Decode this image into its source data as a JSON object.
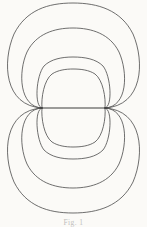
{
  "figure": {
    "caption": "Fig. 1",
    "background_color": "#fbfaf7",
    "line_color": "#4a4a4a",
    "axis_color": "#3d3d3d"
  },
  "chart_data": {
    "type": "line",
    "xlabel": "",
    "ylabel": "",
    "grid": false,
    "legend": "none",
    "xlim": [
      0,
      147
    ],
    "ylim": [
      0,
      227
    ],
    "axis_y": 108,
    "nodes": [
      {
        "name": "left-node",
        "x": 42,
        "y": 108
      },
      {
        "name": "right-node",
        "x": 105,
        "y": 108
      }
    ],
    "axis_segment": {
      "x1": 40,
      "x2": 107,
      "y": 108
    },
    "series": [
      {
        "name": "upper-loop-outer",
        "half": "upper",
        "rank": 1,
        "apex_y": 3,
        "left_x": 3,
        "right_x": 144,
        "path": "M 42 108 C 4 106 2 62 14 34 C 26 10 48 3 73 3 C 98 3 121 10 133 34 C 145 62 143 106 105 108"
      },
      {
        "name": "upper-loop-second",
        "half": "upper",
        "rank": 2,
        "apex_y": 28,
        "left_x": 18,
        "right_x": 129,
        "path": "M 42 108 C 19 107 18 72 27 52 C 36 34 54 28 73 28 C 92 28 110 34 119 52 C 128 72 128 107 105 108"
      },
      {
        "name": "upper-loop-third",
        "half": "upper",
        "rank": 3,
        "apex_y": 57,
        "left_x": 36,
        "right_x": 111,
        "path": "M 42 108 C 34 107 36 76 44 66 C 51 59 62 57 73 57 C 85 57 96 59 103 66 C 111 76 113 107 105 108"
      },
      {
        "name": "upper-loop-inner",
        "half": "upper",
        "rank": 4,
        "apex_y": 69,
        "left_x": 43,
        "right_x": 104,
        "path": "M 42 108 C 41 98 44 80 52 74 C 58 70 66 69 73 69 C 81 69 89 70 95 74 C 103 80 106 98 105 108"
      },
      {
        "name": "lower-loop-outer",
        "half": "lower",
        "rank": 1,
        "apex_y": 212,
        "left_x": 3,
        "right_x": 144,
        "path": "M 42 108 C 4 110 2 154 14 182 C 26 206 48 213 73 213 C 98 213 121 206 133 182 C 145 154 143 110 105 108"
      },
      {
        "name": "lower-loop-second",
        "half": "lower",
        "rank": 2,
        "apex_y": 188,
        "left_x": 18,
        "right_x": 129,
        "path": "M 42 108 C 19 109 18 144 27 164 C 36 182 54 188 73 188 C 92 188 110 182 119 164 C 128 144 128 109 105 108"
      },
      {
        "name": "lower-loop-third",
        "half": "lower",
        "rank": 3,
        "apex_y": 159,
        "left_x": 36,
        "right_x": 111,
        "path": "M 42 108 C 34 109 36 140 44 150 C 51 157 62 159 73 159 C 85 159 96 157 103 150 C 111 140 113 109 105 108"
      },
      {
        "name": "lower-loop-inner",
        "half": "lower",
        "rank": 4,
        "apex_y": 147,
        "left_x": 43,
        "right_x": 104,
        "path": "M 42 108 C 41 118 44 136 52 142 C 58 146 66 147 73 147 C 81 147 89 146 95 142 C 103 136 106 118 105 108"
      }
    ]
  }
}
